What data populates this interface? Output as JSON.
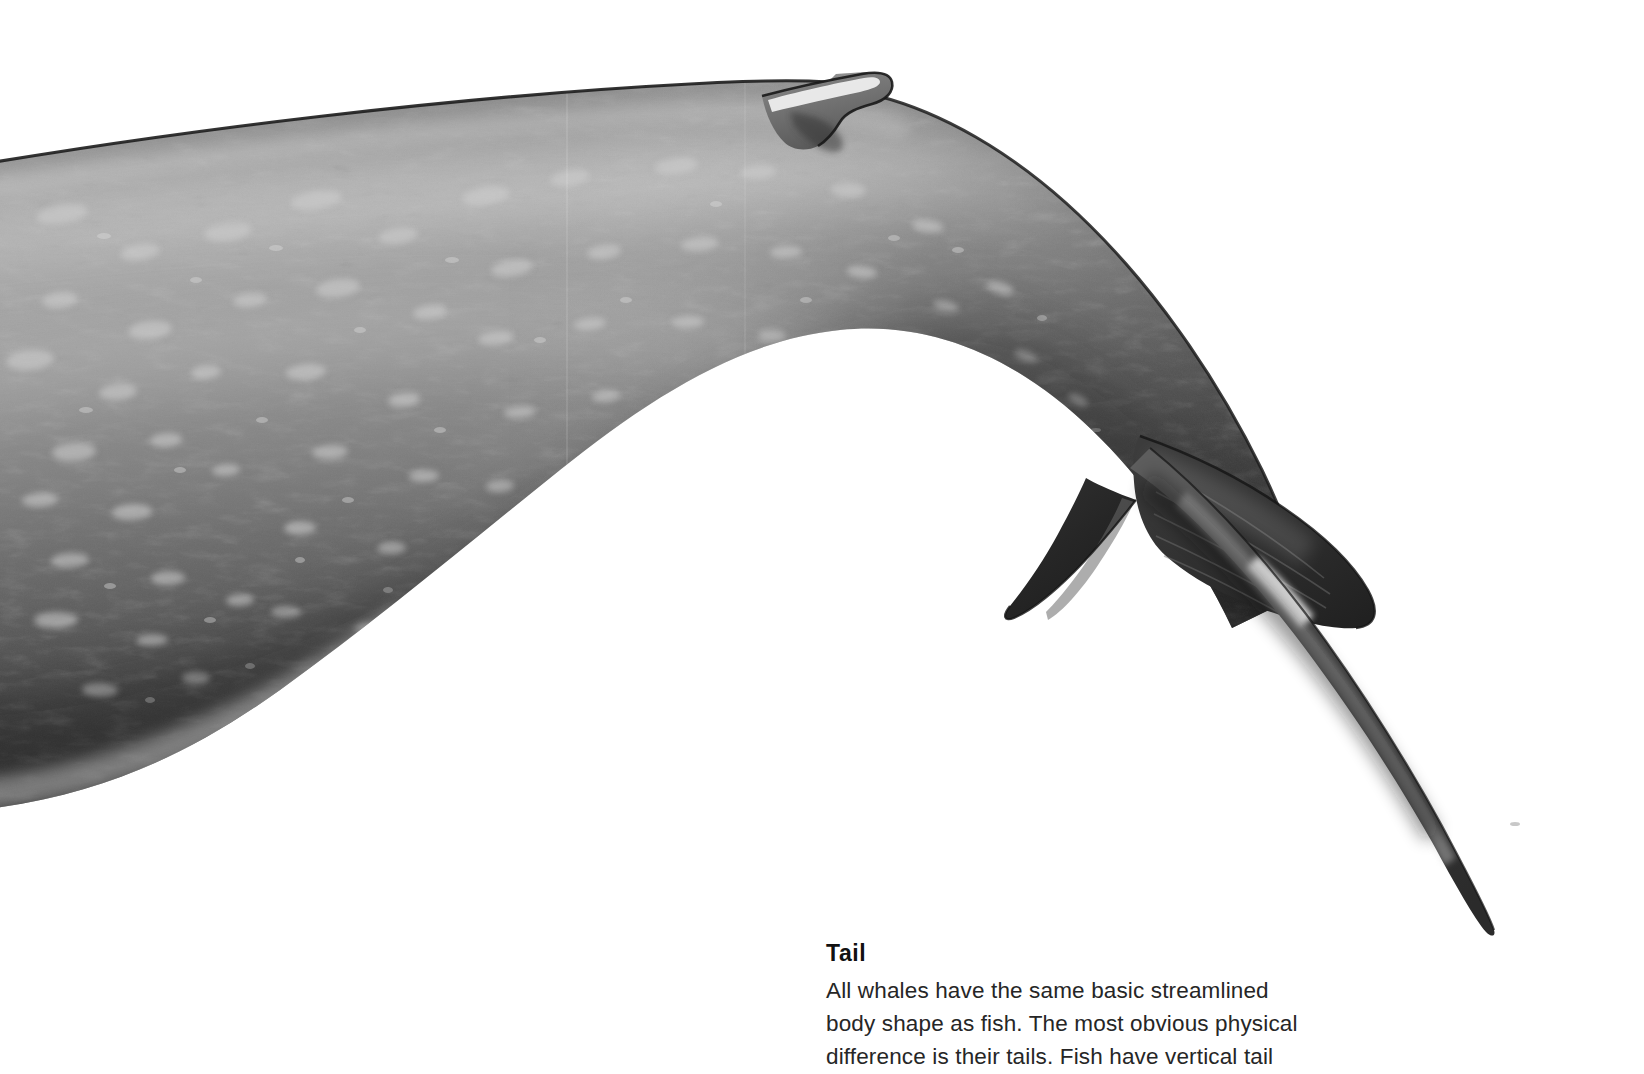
{
  "page": {
    "background_color": "#ffffff",
    "width": 1644,
    "height": 1074
  },
  "illustration": {
    "subject": "whale-rear-body-and-tail",
    "style": "grayscale-airbrush-illustration",
    "description": "Grayscale illustration of the arched rear body, peduncle and tail fluke of a large whale, skin mottled with pale oval spots",
    "parts": [
      {
        "name": "body",
        "label": "Body"
      },
      {
        "name": "dorsal-fin",
        "label": "Dorsal fin"
      },
      {
        "name": "peduncle",
        "label": "Tail stock"
      },
      {
        "name": "fluke-far-lobe",
        "label": "Far fluke lobe"
      },
      {
        "name": "fluke-near-lobe",
        "label": "Near fluke lobe"
      }
    ],
    "colors": {
      "skin_light": "#b9b9b9",
      "skin_mid": "#8c8c8c",
      "skin_dark": "#4a4a4a",
      "skin_deep": "#2d2d2d",
      "fluke_dark": "#2b2b2b",
      "spot_light": "#c9c9c9",
      "highlight": "#efefef",
      "outline": "#1a1a1a",
      "background": "#ffffff"
    }
  },
  "caption": {
    "title": "Tail",
    "lines": [
      "All whales have the same basic streamlined",
      "body shape as fish. The most obvious physical",
      "difference is their tails. Fish have vertical tail"
    ],
    "line1": "All whales have the same basic streamlined",
    "line2": "body shape as fish. The most obvious physical",
    "line3": "difference is their tails. Fish have vertical tail",
    "text_color": "#262626",
    "title_color": "#111111"
  }
}
